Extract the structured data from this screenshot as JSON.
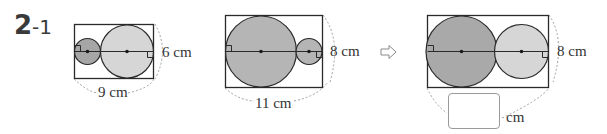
{
  "problem": {
    "number": "2",
    "sub": "-1"
  },
  "figure1": {
    "height_label": "6 cm",
    "width_label": "9 cm",
    "small_circle_fill": "#a6a6a6",
    "large_circle_fill": "#d6d6d6"
  },
  "figure2": {
    "height_label": "8 cm",
    "width_label": "11 cm",
    "circle_fill": "#b5b5b5"
  },
  "arrow": {
    "icon": "hollow-right-arrow"
  },
  "figure3": {
    "height_label": "8 cm",
    "answer_value": "",
    "answer_unit": "cm",
    "large_circle_fill": "#a9a9a9",
    "small_circle_fill": "#d6d6d6"
  },
  "colors": {
    "stroke": "#2a2a2a",
    "dashed": "#a0a0a0"
  }
}
